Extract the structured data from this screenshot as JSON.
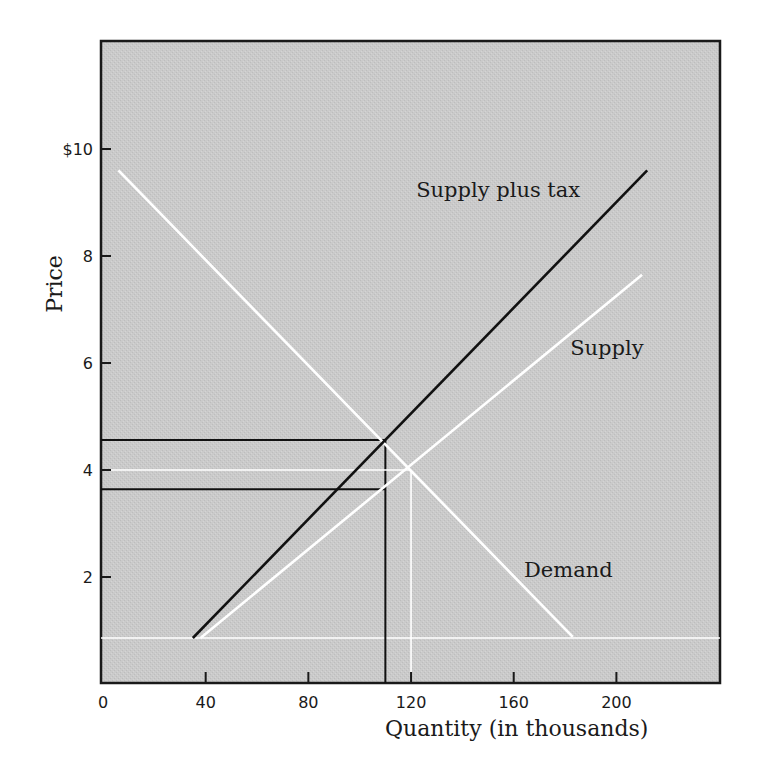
{
  "chart_data": {
    "type": "line",
    "title": "",
    "xlabel": "Quantity (in thousands)",
    "ylabel": "Price",
    "xlim": [
      0,
      240
    ],
    "ylim": [
      0,
      12
    ],
    "x_ticks": [
      0,
      40,
      80,
      120,
      160,
      200
    ],
    "x_tick_labels": [
      "0",
      "40",
      "80",
      "120",
      "160",
      "200"
    ],
    "y_ticks": [
      2,
      4,
      6,
      8,
      10
    ],
    "y_tick_labels": [
      "2",
      "4",
      "6",
      "8",
      "$10"
    ],
    "grid": false,
    "background": "#c9c9c9",
    "series": [
      {
        "name": "Demand",
        "color": "#ffffff",
        "points": [
          [
            6,
            9.6
          ],
          [
            183,
            0.88
          ]
        ]
      },
      {
        "name": "Supply",
        "color": "#ffffff",
        "points": [
          [
            38,
            0.86
          ],
          [
            210,
            7.65
          ]
        ]
      },
      {
        "name": "Supply plus tax",
        "color": "#111111",
        "points": [
          [
            35,
            0.86
          ],
          [
            212,
            9.6
          ]
        ]
      }
    ],
    "reference_lines": [
      {
        "kind": "horizontal",
        "color": "#ffffff",
        "y": 0.86,
        "x_range": [
          0,
          240
        ],
        "meaning": "supply baseline"
      },
      {
        "kind": "horizontal",
        "color": "#111111",
        "y": 4.56,
        "x_range": [
          0,
          110
        ],
        "meaning": "price paid by buyers with tax"
      },
      {
        "kind": "horizontal",
        "color": "#111111",
        "y": 3.64,
        "x_range": [
          0,
          110
        ],
        "meaning": "price received by sellers with tax"
      },
      {
        "kind": "vertical",
        "color": "#111111",
        "x": 110,
        "y_range": [
          0,
          4.56
        ],
        "meaning": "quantity with tax"
      },
      {
        "kind": "horizontal",
        "color": "#ffffff",
        "y": 4.0,
        "x_range": [
          0,
          120
        ],
        "meaning": "equilibrium price without tax"
      },
      {
        "kind": "vertical",
        "color": "#ffffff",
        "x": 120,
        "y_range": [
          0,
          4.0
        ],
        "meaning": "equilibrium quantity without tax"
      }
    ],
    "annotations": [
      {
        "text": "Supply plus tax",
        "x": 122,
        "y": 9.1
      },
      {
        "text": "Supply",
        "x": 182,
        "y": 6.15
      },
      {
        "text": "Demand",
        "x": 164,
        "y": 2.0
      }
    ],
    "equilibria": {
      "without_tax": {
        "quantity": 120,
        "price": 4.0
      },
      "with_tax": {
        "quantity": 110,
        "buyer_price": 4.56,
        "seller_price": 3.64
      }
    },
    "legend": "none (inline curve labels)"
  },
  "labels": {
    "x_axis_title": "Quantity (in thousands)",
    "y_axis_title": "Price",
    "curve_supply_plus_tax": "Supply plus tax",
    "curve_supply": "Supply",
    "curve_demand": "Demand"
  }
}
